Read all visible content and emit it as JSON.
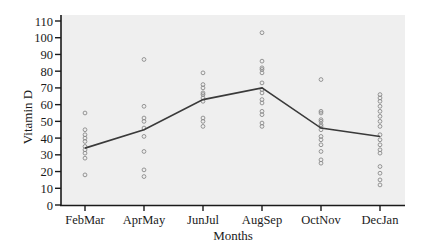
{
  "chart_data": {
    "type": "scatter",
    "title": "",
    "xlabel": "Months",
    "ylabel": "Vitamin D",
    "ylim": [
      0,
      110
    ],
    "yticks": [
      0,
      10,
      20,
      30,
      40,
      50,
      60,
      70,
      80,
      90,
      100,
      110
    ],
    "categories": [
      "FebMar",
      "AprMay",
      "JunJul",
      "AugSep",
      "OctNov",
      "DecJan"
    ],
    "grid": false,
    "legend": null,
    "series": [
      {
        "name": "Individual measurements",
        "type": "scatter",
        "marker": "open-circle",
        "points": [
          [
            55,
            45,
            42,
            40,
            38,
            35,
            33,
            31,
            28,
            18
          ],
          [
            87,
            59,
            52,
            50,
            46,
            41,
            32,
            21,
            17
          ],
          [
            79,
            72,
            70,
            67,
            66,
            64,
            62,
            52,
            50,
            47
          ],
          [
            103,
            86,
            82,
            81,
            79,
            73,
            69,
            67,
            63,
            61,
            56,
            54,
            49,
            47
          ],
          [
            75,
            56,
            55,
            51,
            50,
            48,
            47,
            45,
            41,
            39,
            36,
            32,
            27,
            25
          ],
          [
            66,
            64,
            62,
            59,
            56,
            53,
            50,
            47,
            42,
            39,
            36,
            33,
            31,
            23,
            19,
            15,
            12
          ]
        ]
      },
      {
        "name": "Mean",
        "type": "line",
        "values": [
          34,
          45,
          63,
          70,
          46,
          41
        ]
      }
    ]
  },
  "colors": {
    "plot_background": "#efefef",
    "axis": "#1a1a1a",
    "line": "#3a3a3a",
    "marker": "#8a8a8a"
  }
}
